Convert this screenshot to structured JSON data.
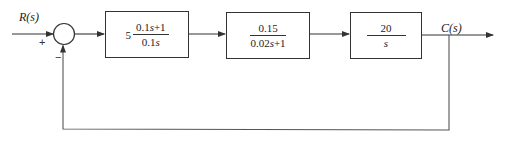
{
  "diagram": {
    "type": "closed-loop block diagram",
    "input_label": "R(s)",
    "output_label": "C(s)",
    "summing_junction": {
      "plus_sign": "+",
      "minus_sign": "−"
    },
    "blocks": [
      {
        "gain": "5",
        "numerator_plain": "0.1s+1",
        "denominator_plain": "0.1s",
        "numerator": [
          "0.1",
          "s",
          "+1"
        ],
        "denominator": [
          "0.1",
          "s"
        ]
      },
      {
        "numerator_plain": "0.15",
        "denominator_plain": "0.02s+1",
        "numerator": [
          "0.15"
        ],
        "denominator": [
          "0.02",
          "s",
          "+1"
        ]
      },
      {
        "numerator_plain": "20",
        "denominator_plain": "s",
        "numerator": [
          "20"
        ],
        "denominator": [
          "s"
        ]
      }
    ],
    "feedback": "unity negative feedback",
    "colors": {
      "line": "#333333",
      "background": "#ffffff"
    }
  }
}
